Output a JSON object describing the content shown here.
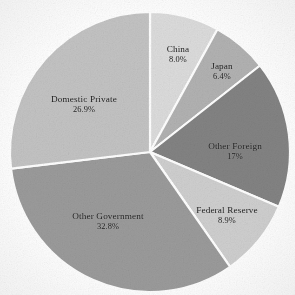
{
  "figure": {
    "background_color": "#ffffff",
    "label_text_color": "#1b1b1b",
    "separator_color": "#ffffff"
  },
  "chart_data": {
    "type": "pie",
    "title": "",
    "subtitle": "",
    "xlabel": "",
    "ylabel": "",
    "legend_position": "none",
    "grid": false,
    "labels_on_slices": true,
    "start_angle_clock": "12 o'clock",
    "direction": "clockwise",
    "center": {
      "x": 150,
      "y": 152
    },
    "radius": 140,
    "categories": [
      "China",
      "Japan",
      "Other Foreign",
      "Federal Reserve",
      "Other Government",
      "Domestic Private"
    ],
    "values": [
      8.0,
      6.4,
      17.0,
      8.9,
      32.8,
      26.9
    ],
    "value_labels": [
      "8.0%",
      "6.4%",
      "17%",
      "8.9%",
      "32.8%",
      "26.9%"
    ],
    "total": 100.0,
    "slices": [
      {
        "label": "China",
        "value_label": "8.0%",
        "value": 8.0,
        "color": "#dcdcdc",
        "start_deg": 0.0,
        "end_deg": 28.8,
        "label_x": 178,
        "label_y": 55
      },
      {
        "label": "Japan",
        "value_label": "6.4%",
        "value": 6.4,
        "color": "#b2b2b2",
        "start_deg": 28.8,
        "end_deg": 51.84,
        "label_x": 222,
        "label_y": 72
      },
      {
        "label": "Other Foreign",
        "value_label": "17%",
        "value": 17.0,
        "color": "#838383",
        "start_deg": 51.84,
        "end_deg": 113.04,
        "label_x": 235,
        "label_y": 152
      },
      {
        "label": "Federal Reserve",
        "value_label": "8.9%",
        "value": 8.9,
        "color": "#cfcfcf",
        "start_deg": 113.04,
        "end_deg": 145.08,
        "label_x": 227,
        "label_y": 216
      },
      {
        "label": "Other Government",
        "value_label": "32.8%",
        "value": 32.8,
        "color": "#9b9b9b",
        "start_deg": 145.08,
        "end_deg": 263.16,
        "label_x": 108,
        "label_y": 222
      },
      {
        "label": "Domestic Private",
        "value_label": "26.9%",
        "value": 26.9,
        "color": "#c3c3c3",
        "start_deg": 263.16,
        "end_deg": 360.0,
        "label_x": 84,
        "label_y": 105
      }
    ]
  }
}
